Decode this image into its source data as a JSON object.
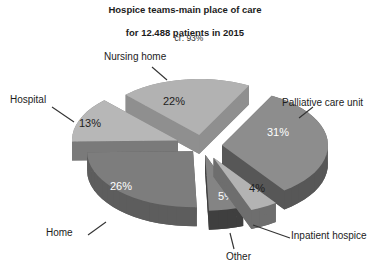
{
  "header": {
    "title_line1": "Hospice teams-main place of care",
    "title_line2": "for 12.488 patients in 2015",
    "subtitle": "cr: 93%"
  },
  "chart_data": {
    "type": "pie",
    "style": "3d-exploded",
    "title": "Hospice teams-main place of care for 12.488 patients in 2015",
    "subtitle": "cr: 93%",
    "unit": "%",
    "legend_position": "none",
    "labels_outside": true,
    "slices": [
      {
        "label": "Nursing home",
        "value": 22,
        "pct_label": "22%",
        "top_color": "#b2b2b2",
        "side_color": "#8f8f8f",
        "pct_color": "#1d1d1d"
      },
      {
        "label": "Hospital",
        "value": 13,
        "pct_label": "13%",
        "top_color": "#b7b7b7",
        "side_color": "#7a7a7a",
        "pct_color": "#1d1d1d"
      },
      {
        "label": "Home",
        "value": 26,
        "pct_label": "26%",
        "top_color": "#7d7d7d",
        "side_color": "#5d5d5d",
        "pct_color": "#ffffff"
      },
      {
        "label": "Other",
        "value": 5,
        "pct_label": "5%",
        "top_color": "#848484",
        "side_color": "#3f3f3f",
        "pct_color": "#ffffff"
      },
      {
        "label": "Inpatient hospice",
        "value": 4,
        "pct_label": "4%",
        "top_color": "#b3b3b3",
        "side_color": "#6e6e6e",
        "pct_color": "#1d1d1d"
      },
      {
        "label": "Palliative care unit",
        "value": 31,
        "pct_label": "31%",
        "top_color": "#8d8d8d",
        "side_color": "#575757",
        "pct_color": "#ffffff"
      }
    ]
  }
}
